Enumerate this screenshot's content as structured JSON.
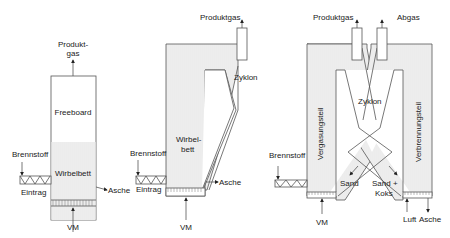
{
  "diagrams": [
    {
      "name": "Stationaere Wirbelschicht",
      "labels": {
        "product_gas_line1": "Produkt-",
        "product_gas_line2": "gas",
        "freeboard": "Freeboard",
        "bed": "Wirbelbett",
        "fuel": "Brennstoff",
        "feed": "Eintrag",
        "ash": "Asche",
        "fluidizing_medium": "VM"
      }
    },
    {
      "name": "Zirkulierende Wirbelschicht",
      "labels": {
        "product_gas": "Produktgas",
        "cyclone": "Zyklon",
        "bed_line1": "Wirbel-",
        "bed_line2": "bett",
        "fuel": "Brennstoff",
        "feed": "Eintrag",
        "ash": "Asche",
        "fluidizing_medium": "VM"
      }
    },
    {
      "name": "Zweibett-Wirbelschicht",
      "labels": {
        "product_gas": "Produktgas",
        "flue_gas": "Abgas",
        "cyclone": "Zyklon",
        "gasification": "Vergasungsteil",
        "combustion": "Verbrennungsteil",
        "fuel": "Brennstoff",
        "sand": "Sand",
        "sand_coke_line1": "Sand +",
        "sand_coke_line2": "Koks",
        "fluidizing_medium": "VM",
        "air": "Luft",
        "ash": "Asche"
      }
    }
  ],
  "colors": {
    "line": "#555555",
    "shade": "#ececec",
    "text": "#222222"
  }
}
